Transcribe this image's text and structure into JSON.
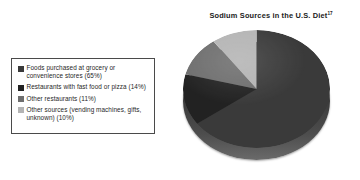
{
  "chart_data": {
    "type": "pie",
    "title": "Sodium Sources in the U.S. Diet",
    "title_superscript": "17",
    "categories": [
      "Foods purchased at grocery or convenience stores",
      "Restaurants with fast food or pizza",
      "Other restaurants",
      "Other sources (vending machines, gifts, unknown)"
    ],
    "values": [
      65,
      14,
      11,
      10
    ],
    "value_unit": "%",
    "legend_position": "left",
    "grid": false,
    "xlabel": "",
    "ylabel": "",
    "style": "3d-pie",
    "start_angle_deg": 0,
    "direction": "clockwise",
    "slice_colors": [
      "#3a3a3a",
      "#222222",
      "#6e6e6e",
      "#b4b4b4"
    ]
  },
  "legend": {
    "items": [
      {
        "label": "Foods purchased at grocery or convenience stores (65%)",
        "color": "#3a3a3a",
        "value": 65
      },
      {
        "label": "Restaurants with fast food or pizza (14%)",
        "color": "#222222",
        "value": 14
      },
      {
        "label": "Other restaurants (11%)",
        "color": "#6e6e6e",
        "value": 11
      },
      {
        "label": "Other sources (vending machines, gifts, unknown) (10%)",
        "color": "#b4b4b4",
        "value": 10
      }
    ]
  },
  "colors": {
    "background": "#ffffff",
    "text": "#1b1b1b",
    "legend_border": "#4a4a4a"
  }
}
